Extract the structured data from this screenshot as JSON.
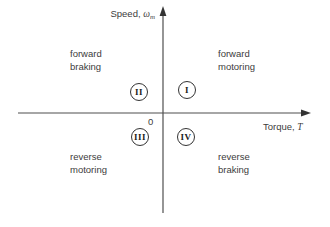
{
  "diagram": {
    "title_semantic": "four-quadrant-torque-speed-plane",
    "y_axis_label": {
      "prefix": "Speed, ",
      "symbol": "ω",
      "subscript": "m"
    },
    "x_axis_label": {
      "prefix": "Torque, ",
      "symbol": "T"
    },
    "origin_label": "0",
    "quadrants": [
      {
        "numeral": "I",
        "line1": "forward",
        "line2": "motoring",
        "position": "upper-right"
      },
      {
        "numeral": "II",
        "line1": "forward",
        "line2": "braking",
        "position": "upper-left"
      },
      {
        "numeral": "III",
        "line1": "reverse",
        "line2": "motoring",
        "position": "lower-left"
      },
      {
        "numeral": "IV",
        "line1": "reverse",
        "line2": "braking",
        "position": "lower-right"
      }
    ],
    "colors": {
      "background": "#ffffff",
      "axis_line": "#4f4f4f",
      "text": "#3c3c3c",
      "circle_outline": "#333333"
    }
  }
}
